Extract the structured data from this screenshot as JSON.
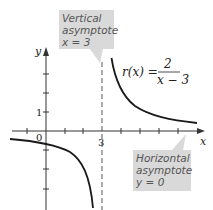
{
  "figure": {
    "function_label": {
      "lhs": "r(x) =",
      "numerator": "2",
      "denominator": "x − 3"
    },
    "axes": {
      "x_label": "x",
      "y_label": "y",
      "origin_label": "0",
      "x_tick_label": "3",
      "y_tick_label": "1"
    },
    "callouts": {
      "vertical": {
        "line1": "Vertical",
        "line2": "asymptote",
        "line3": "x = 3"
      },
      "horizontal": {
        "line1": "Horizontal",
        "line2": "asymptote",
        "line3": "y = 0"
      }
    },
    "colors": {
      "callout_fill": "#d9d9d9",
      "curve": "#1a1a1a",
      "axis": "#333333",
      "asymptote": "#555555"
    }
  }
}
